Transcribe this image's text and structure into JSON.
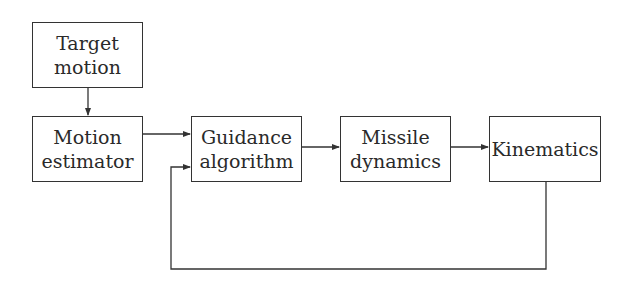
{
  "diagram": {
    "type": "block-diagram",
    "blocks": [
      {
        "id": "target_motion",
        "label": "Target\nmotion"
      },
      {
        "id": "motion_estimator",
        "label": "Motion\nestimator"
      },
      {
        "id": "guidance_algorithm",
        "label": "Guidance\nalgorithm"
      },
      {
        "id": "missile_dynamics",
        "label": "Missile\ndynamics"
      },
      {
        "id": "kinematics",
        "label": "Kinematics"
      }
    ],
    "connections": [
      {
        "from": "target_motion",
        "to": "motion_estimator"
      },
      {
        "from": "motion_estimator",
        "to": "guidance_algorithm"
      },
      {
        "from": "guidance_algorithm",
        "to": "missile_dynamics"
      },
      {
        "from": "missile_dynamics",
        "to": "kinematics"
      },
      {
        "from": "kinematics",
        "to": "guidance_algorithm",
        "kind": "feedback"
      }
    ],
    "line_color": "#333333"
  }
}
